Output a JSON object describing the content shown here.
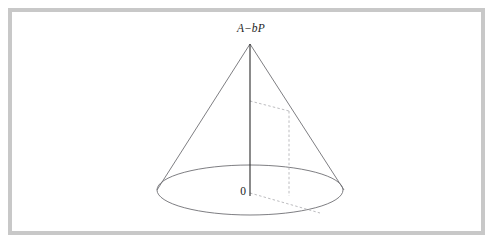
{
  "figure": {
    "title_alt": "Cone diagram with height A minus bP",
    "background_color": "#ffffff",
    "frame": {
      "color": "#c8c8c8",
      "thickness_px": 4,
      "x": 8,
      "y": 8,
      "width": 477,
      "height": 227
    },
    "labels": {
      "apex": "A−bP",
      "apex_parts": {
        "lead": "A",
        "operator": "−",
        "trail": "bP"
      },
      "origin": "0"
    },
    "colors": {
      "outline": "#6f6f74",
      "axis": "#2b2b2b",
      "dashed": "#b4b4b8",
      "text": "#1d1d1d"
    },
    "geometry": {
      "apex": {
        "x": 250,
        "y": 44
      },
      "base_center": {
        "x": 250,
        "y": 190
      },
      "base_rx": 93,
      "base_ry": 25,
      "axis_bottom": {
        "x": 250,
        "y": 196
      },
      "left_rim": {
        "x": 157,
        "y": 190
      },
      "right_rim": {
        "x": 344,
        "y": 190
      },
      "inner_top": {
        "x": 250,
        "y": 101
      },
      "inner_corner": {
        "x": 289,
        "y": 111
      },
      "inner_foot": {
        "x": 289,
        "y": 196
      },
      "radius_end": {
        "x": 320,
        "y": 213
      }
    }
  }
}
